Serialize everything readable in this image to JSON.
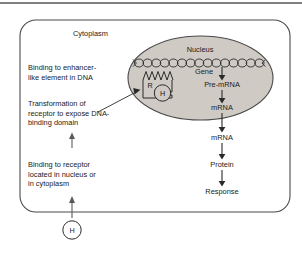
{
  "figure": {
    "type": "biological-pathway-diagram",
    "topic": "Nuclear receptor hormone signaling"
  },
  "compartments": {
    "cytoplasm_label": "Cytoplasm",
    "nucleus_label": "Nucleus"
  },
  "nucleus": {
    "gene_label": "Gene",
    "dna_label": "DNA strand",
    "receptor_label": "R",
    "hormone_label": "H"
  },
  "pathway": {
    "steps": [
      {
        "label": "Pre-mRNA"
      },
      {
        "label": "mRNA"
      },
      {
        "label": "mRNA"
      },
      {
        "label": "Protein"
      },
      {
        "label": "Response"
      }
    ]
  },
  "annotations": {
    "enhancer": {
      "lines": [
        "Binding to enhancer-",
        "like element in DNA"
      ]
    },
    "transformation": {
      "lines": [
        "Transformation of",
        "receptor to expose DNA-",
        "binding domain"
      ]
    },
    "receptor_binding": {
      "lines": [
        "Binding to receptor",
        "located in nucleus or",
        "in cytoplasm"
      ]
    }
  },
  "hormone": {
    "label": "H"
  },
  "colors": {
    "background": "#ffffff",
    "nucleus_fill": "#cfcac4",
    "stroke": "#3a3a3a",
    "text": "#1a1a1a",
    "rule": "#808080"
  }
}
